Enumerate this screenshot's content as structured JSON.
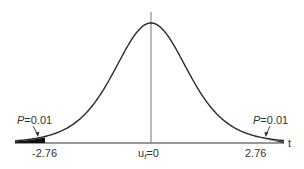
{
  "figure": {
    "title": "",
    "curve": "t-distribution density",
    "axis_label": "t",
    "ticks": [
      {
        "label": "-2.76",
        "value": -2.76
      },
      {
        "label": "u_t=0",
        "value": 0
      },
      {
        "label": "2.76",
        "value": 2.76
      }
    ],
    "tick_left": "-2.76",
    "tick_center_main": "u",
    "tick_center_sub": "t",
    "tick_center_rest": "=0",
    "tick_right": "2.76",
    "left_tail": {
      "label": "P=0.01",
      "p_italic": "P",
      "rest": "=0.01"
    },
    "right_tail": {
      "label": "P=0.01",
      "p_italic": "P",
      "rest": "=0.01"
    },
    "colors": {
      "curve": "#2a2a2a",
      "axis": "#333333",
      "fill": "#111111",
      "centerline": "#777777"
    }
  }
}
